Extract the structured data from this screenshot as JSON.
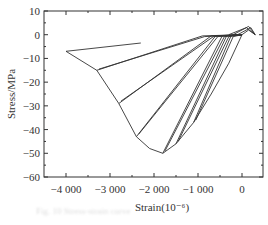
{
  "chart_data": {
    "type": "line",
    "title": "",
    "xlabel": "Strain(10⁻⁶)",
    "ylabel": "Stress/MPa",
    "xlim": [
      -4500,
      300
    ],
    "ylim": [
      -60,
      10
    ],
    "x_ticks": [
      -4000,
      -3000,
      -2000,
      -1000,
      0
    ],
    "x_tick_labels": [
      "−4 000",
      "−3 000",
      "−2 000",
      "−1 000",
      "0"
    ],
    "y_ticks": [
      10,
      0,
      -10,
      -20,
      -30,
      -40,
      -50,
      -60
    ],
    "y_tick_labels": [
      "10",
      "0",
      "−10",
      "−20",
      "−30",
      "−40",
      "−50",
      "−60"
    ],
    "grid": false,
    "legend": null,
    "envelope": {
      "x": [
        0,
        -300,
        -700,
        -1100,
        -1500,
        -1800,
        -2100,
        -2400,
        -2800,
        -3300,
        -4000
      ],
      "y": [
        0,
        -12,
        -25,
        -37,
        -46,
        -50,
        -48,
        -43,
        -29,
        -15,
        -7
      ]
    },
    "series": [
      {
        "name": "loop-1",
        "x": [
          -4000,
          -2300
        ],
        "y": [
          -7,
          -3.5
        ]
      },
      {
        "name": "loop-2",
        "x": [
          -3300,
          -900,
          0,
          -850,
          -3250
        ],
        "y": [
          -15,
          -0.5,
          0,
          -0.8,
          -14.5
        ]
      },
      {
        "name": "loop-3",
        "x": [
          -2800,
          -700,
          0,
          -650,
          -2750
        ],
        "y": [
          -29,
          -0.5,
          0,
          -0.8,
          -28
        ]
      },
      {
        "name": "loop-4",
        "x": [
          -2400,
          -600,
          0,
          -550,
          -2350
        ],
        "y": [
          -43,
          -0.5,
          0,
          -0.8,
          -42
        ]
      },
      {
        "name": "loop-5",
        "x": [
          -1800,
          -450,
          0,
          -400,
          -1750
        ],
        "y": [
          -50,
          -0.5,
          0,
          -0.8,
          -49
        ]
      },
      {
        "name": "loop-6",
        "x": [
          -1500,
          -350,
          0,
          -300,
          -1450
        ],
        "y": [
          -46,
          -0.5,
          0,
          -0.8,
          -45
        ]
      },
      {
        "name": "loop-7",
        "x": [
          -1100,
          -250,
          0,
          -200,
          -1050
        ],
        "y": [
          -37,
          -0.5,
          0,
          -0.8,
          -36
        ]
      }
    ]
  },
  "caption": "Fig. 10  Stress-strain curve"
}
